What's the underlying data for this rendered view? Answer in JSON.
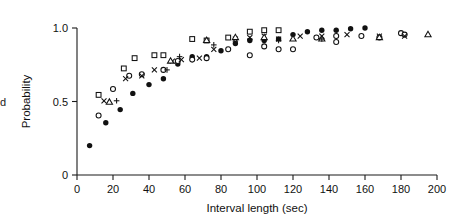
{
  "figure": {
    "edge_fragment": "d",
    "background_color": "#ffffff",
    "ink_color": "#111111"
  },
  "chart_data": {
    "type": "scatter",
    "title": "",
    "xlabel": "Interval length (sec)",
    "ylabel": "Probability",
    "xlim": [
      0,
      200
    ],
    "ylim": [
      0,
      1.0
    ],
    "xticks": [
      0,
      20,
      40,
      60,
      80,
      100,
      120,
      140,
      160,
      180,
      200
    ],
    "xticklabels": [
      "0",
      "20",
      "40",
      "60",
      "80",
      "100",
      "120",
      "140",
      "160",
      "180",
      "200"
    ],
    "yticks": [
      0,
      0.5,
      1.0
    ],
    "yticklabels": [
      "0",
      "0.5",
      "1.0"
    ],
    "grid": false,
    "legend": "none",
    "series": [
      {
        "name": "series-filled-circle",
        "marker": "filled-circle",
        "points": [
          [
            7,
            0.2
          ],
          [
            16,
            0.355
          ],
          [
            24,
            0.445
          ],
          [
            31,
            0.555
          ],
          [
            40,
            0.615
          ],
          [
            48,
            0.655
          ],
          [
            56,
            0.755
          ],
          [
            64,
            0.805
          ],
          [
            72,
            0.805
          ],
          [
            80,
            0.845
          ],
          [
            88,
            0.895
          ],
          [
            96,
            0.915
          ],
          [
            104,
            0.915
          ],
          [
            112,
            0.925
          ],
          [
            120,
            0.955
          ],
          [
            128,
            0.975
          ],
          [
            136,
            0.985
          ],
          [
            144,
            0.985
          ],
          [
            152,
            0.995
          ],
          [
            160,
            1.0
          ]
        ]
      },
      {
        "name": "series-open-circle",
        "marker": "open-circle",
        "points": [
          [
            12,
            0.405
          ],
          [
            20,
            0.585
          ],
          [
            29,
            0.675
          ],
          [
            36,
            0.685
          ],
          [
            48,
            0.715
          ],
          [
            56,
            0.775
          ],
          [
            64,
            0.785
          ],
          [
            72,
            0.795
          ],
          [
            84,
            0.855
          ],
          [
            96,
            0.815
          ],
          [
            104,
            0.875
          ],
          [
            112,
            0.855
          ],
          [
            120,
            0.855
          ],
          [
            133,
            0.935
          ],
          [
            144,
            0.945
          ],
          [
            144,
            0.905
          ],
          [
            158,
            0.945
          ],
          [
            168,
            0.935
          ],
          [
            180,
            0.965
          ],
          [
            182,
            0.955
          ]
        ]
      },
      {
        "name": "series-open-square",
        "marker": "open-square",
        "points": [
          [
            12,
            0.545
          ],
          [
            26,
            0.725
          ],
          [
            32,
            0.795
          ],
          [
            43,
            0.815
          ],
          [
            48,
            0.815
          ],
          [
            64,
            0.925
          ],
          [
            72,
            0.915
          ],
          [
            84,
            0.935
          ],
          [
            96,
            0.975
          ],
          [
            104,
            0.985
          ],
          [
            112,
            0.985
          ]
        ]
      },
      {
        "name": "series-x-mark",
        "marker": "x",
        "points": [
          [
            15,
            0.505
          ],
          [
            27,
            0.655
          ],
          [
            36,
            0.675
          ],
          [
            43,
            0.715
          ],
          [
            53,
            0.775
          ],
          [
            58,
            0.785
          ],
          [
            68,
            0.795
          ],
          [
            76,
            0.855
          ],
          [
            88,
            0.925
          ],
          [
            96,
            0.935
          ],
          [
            104,
            0.945
          ],
          [
            112,
            0.925
          ],
          [
            124,
            0.945
          ],
          [
            136,
            0.945
          ],
          [
            150,
            0.955
          ],
          [
            168,
            0.945
          ],
          [
            182,
            0.945
          ]
        ]
      },
      {
        "name": "series-triangle",
        "marker": "open-triangle",
        "points": [
          [
            18,
            0.495
          ],
          [
            52,
            0.775
          ],
          [
            72,
            0.915
          ],
          [
            88,
            0.935
          ],
          [
            104,
            0.935
          ],
          [
            120,
            0.925
          ],
          [
            136,
            0.925
          ],
          [
            168,
            0.935
          ],
          [
            195,
            0.955
          ]
        ]
      },
      {
        "name": "series-plus",
        "marker": "plus",
        "points": [
          [
            22,
            0.505
          ],
          [
            50,
            0.715
          ],
          [
            57,
            0.805
          ],
          [
            76,
            0.885
          ],
          [
            96,
            0.925
          ],
          [
            112,
            0.915
          ],
          [
            136,
            0.925
          ]
        ]
      }
    ]
  }
}
